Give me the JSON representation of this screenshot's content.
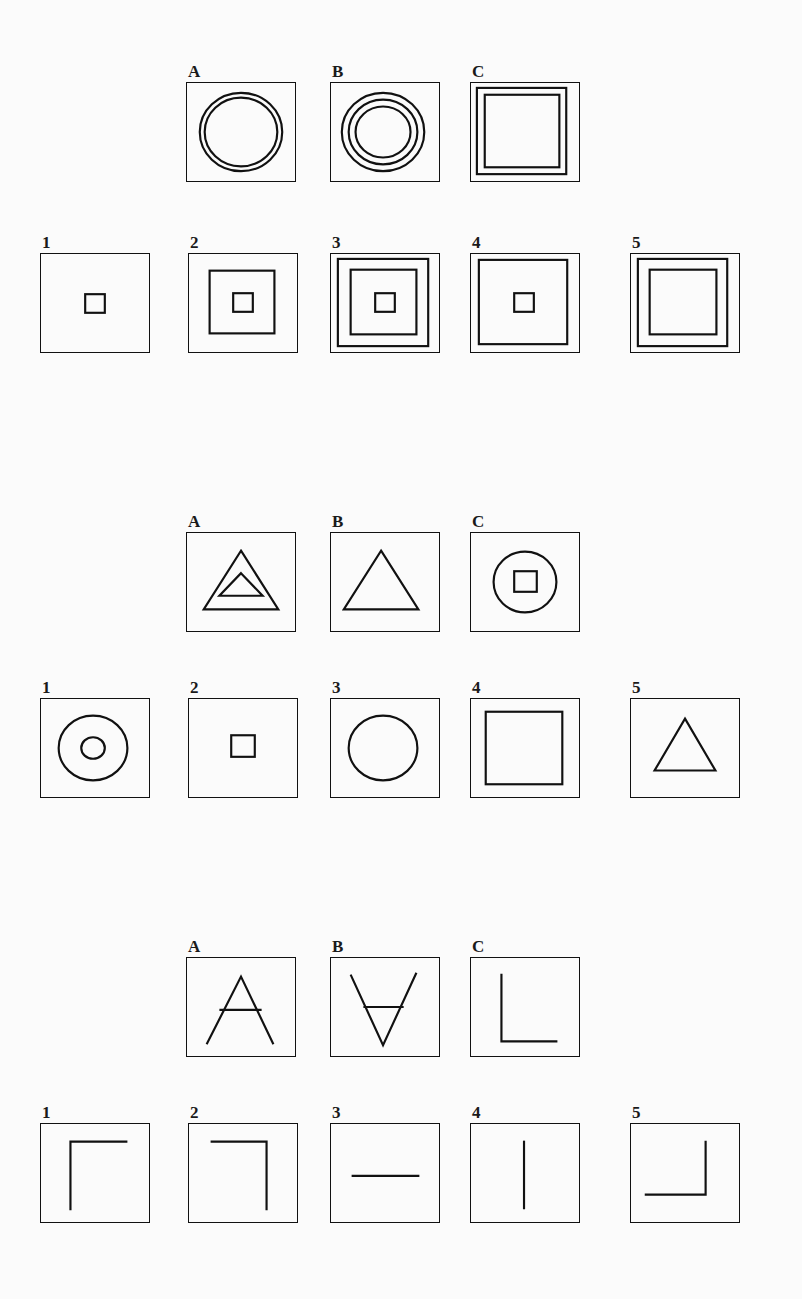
{
  "page": {
    "kind": "figural-analogy-test-sheet",
    "background_color": "#fbfbfb",
    "ink_color": "#111111",
    "problem_count": 3
  },
  "problems": [
    {
      "id": "problem-1",
      "stem_labels": [
        "A",
        "B",
        "C"
      ],
      "option_labels": [
        "1",
        "2",
        "3",
        "4",
        "5"
      ],
      "stems": [
        {
          "label": "A",
          "figure": "two-concentric-circles",
          "description": "Square frame containing 2 concentric circles"
        },
        {
          "label": "B",
          "figure": "three-concentric-circles",
          "description": "Square frame containing 3 concentric circles"
        },
        {
          "label": "C",
          "figure": "three-nested-squares",
          "description": "Square frame plus 2 nested squares inside"
        }
      ],
      "options": [
        {
          "label": "1",
          "figure": "frame-with-tiny-square",
          "description": "Square frame with a tiny centre square"
        },
        {
          "label": "2",
          "figure": "frame-mid-square-tiny-square",
          "description": "Square frame, one medium square, tiny centre square"
        },
        {
          "label": "3",
          "figure": "frame-two-squares-tiny-square",
          "description": "Square frame, two nested squares, tiny centre square"
        },
        {
          "label": "4",
          "figure": "frame-large-square-tiny-square",
          "description": "Square frame, one large inner square, tiny centre square"
        },
        {
          "label": "5",
          "figure": "three-nested-squares-no-centre",
          "description": "Square frame plus two nested squares, no centre square"
        }
      ]
    },
    {
      "id": "problem-2",
      "stem_labels": [
        "A",
        "B",
        "C"
      ],
      "option_labels": [
        "1",
        "2",
        "3",
        "4",
        "5"
      ],
      "stems": [
        {
          "label": "A",
          "figure": "two-nested-triangles",
          "description": "Square frame containing a triangle with a smaller triangle inside"
        },
        {
          "label": "B",
          "figure": "single-triangle",
          "description": "Square frame containing one triangle"
        },
        {
          "label": "C",
          "figure": "circle-with-square",
          "description": "Square frame containing a circle with a small square inside"
        }
      ],
      "options": [
        {
          "label": "1",
          "figure": "circle-with-small-circle",
          "description": "Square frame containing a circle with a small circle inside"
        },
        {
          "label": "2",
          "figure": "small-square",
          "description": "Square frame containing a small square"
        },
        {
          "label": "3",
          "figure": "single-circle",
          "description": "Square frame containing one circle"
        },
        {
          "label": "4",
          "figure": "single-square",
          "description": "Square frame containing one large square"
        },
        {
          "label": "5",
          "figure": "single-triangle",
          "description": "Square frame containing one triangle"
        }
      ]
    },
    {
      "id": "problem-3",
      "stem_labels": [
        "A",
        "B",
        "C"
      ],
      "option_labels": [
        "1",
        "2",
        "3",
        "4",
        "5"
      ],
      "stems": [
        {
          "label": "A",
          "figure": "letter-a",
          "description": "Square frame containing the letter A"
        },
        {
          "label": "B",
          "figure": "letter-a-inverted",
          "description": "Square frame containing an upside-down letter A"
        },
        {
          "label": "C",
          "figure": "letter-l",
          "description": "Square frame containing the letter L"
        }
      ],
      "options": [
        {
          "label": "1",
          "figure": "corner-top-left",
          "description": "Vertical stroke at left joined to horizontal stroke at top, going right"
        },
        {
          "label": "2",
          "figure": "corner-top-right",
          "description": "Horizontal stroke at top joined to vertical stroke at right, going down"
        },
        {
          "label": "3",
          "figure": "horizontal-line",
          "description": "Single horizontal line"
        },
        {
          "label": "4",
          "figure": "vertical-line",
          "description": "Single vertical line"
        },
        {
          "label": "5",
          "figure": "corner-bottom-right",
          "description": "Vertical stroke at right joined to horizontal stroke at bottom, going left"
        }
      ]
    }
  ]
}
